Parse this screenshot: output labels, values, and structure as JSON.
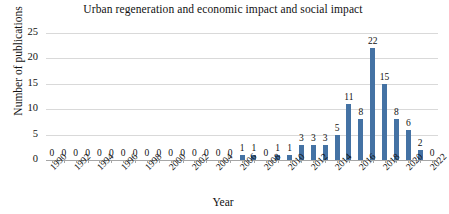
{
  "chart_data": {
    "type": "bar",
    "title": "Urban regeneration and economic impact and social impact",
    "xlabel": "Year",
    "ylabel": "Number of publications",
    "categories": [
      1990,
      1991,
      1992,
      1993,
      1994,
      1995,
      1996,
      1997,
      1998,
      1999,
      2000,
      2001,
      2002,
      2003,
      2004,
      2005,
      2006,
      2007,
      2008,
      2009,
      2010,
      2011,
      2012,
      2013,
      2014,
      2015,
      2016,
      2017,
      2018,
      2019,
      2020,
      2021,
      2022
    ],
    "values": [
      0,
      0,
      0,
      0,
      0,
      0,
      0,
      0,
      0,
      0,
      0,
      0,
      0,
      0,
      0,
      0,
      1,
      1,
      0,
      1,
      1,
      3,
      3,
      3,
      5,
      11,
      8,
      22,
      15,
      8,
      6,
      2,
      0
    ],
    "value_labels": [
      "0",
      "0",
      "0",
      "0",
      "0",
      "0",
      "0",
      "0",
      "0",
      "0",
      "0",
      "0",
      "0",
      "0",
      "0",
      "0",
      "1",
      "1",
      "0",
      "1",
      "1",
      "3",
      "3",
      "3",
      "5",
      "11",
      "8",
      "22",
      "15",
      "8",
      "6",
      "2",
      "0"
    ],
    "ylim": [
      0,
      25
    ],
    "yticks": [
      0,
      5,
      10,
      15,
      20,
      25
    ],
    "ytick_labels": [
      "0",
      "5",
      "10",
      "15",
      "20",
      "25"
    ],
    "xtick_labels": [
      "1990",
      "1992",
      "1994",
      "1996",
      "1998",
      "2000",
      "2002",
      "2004",
      "2006",
      "2008",
      "2010",
      "2012",
      "2014",
      "2016",
      "2018",
      "2020",
      "2022"
    ],
    "xtick_step": 2,
    "grid": true,
    "legend": false,
    "series_color": "#4472A4",
    "grid_color": "#d9d9d9",
    "axis_color": "#a6a6a6",
    "data_labels_shown": true
  }
}
